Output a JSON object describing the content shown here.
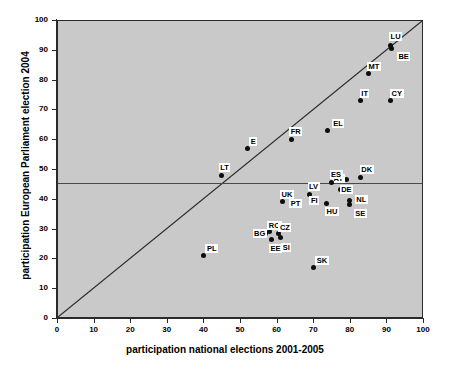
{
  "chart_data": {
    "type": "scatter",
    "title": "",
    "xlabel": "participation national elections 2001-2005",
    "ylabel": "participation European Parliament election 2004",
    "xlim": [
      0,
      100
    ],
    "ylim": [
      0,
      100
    ],
    "xticks": [
      0,
      10,
      20,
      30,
      40,
      50,
      60,
      70,
      80,
      90,
      100
    ],
    "yticks": [
      0,
      10,
      20,
      30,
      40,
      50,
      60,
      70,
      80,
      90,
      100
    ],
    "grid": false,
    "legend": null,
    "point_color": "#0d0d0d",
    "plot_background": "#c9c9c9",
    "reference_lines": [
      {
        "name": "equality-line",
        "type": "diagonal",
        "from": [
          0,
          0
        ],
        "to": [
          100,
          100
        ]
      },
      {
        "name": "eu-average-line",
        "type": "horizontal",
        "y": 45.5
      }
    ],
    "points": [
      {
        "label": "LU",
        "x": 91.0,
        "y": 91.5,
        "label_dx": -1,
        "label_dy": -13
      },
      {
        "label": "BE",
        "x": 91.5,
        "y": 90.5,
        "label_dx": 5,
        "label_dy": 4
      },
      {
        "label": "MT",
        "x": 85.0,
        "y": 82.0,
        "label_dx": -1,
        "label_dy": -12
      },
      {
        "label": "IT",
        "x": 83.0,
        "y": 73.0,
        "label_dx": -1,
        "label_dy": -12
      },
      {
        "label": "CY",
        "x": 91.0,
        "y": 73.0,
        "label_dx": 0,
        "label_dy": -12
      },
      {
        "label": "EL",
        "x": 74.0,
        "y": 63.0,
        "label_dx": 4,
        "label_dy": -11
      },
      {
        "label": "FR",
        "x": 64.0,
        "y": 60.0,
        "label_dx": -2,
        "label_dy": -12
      },
      {
        "label": "E",
        "x": 52.0,
        "y": 57.0,
        "label_dx": 2,
        "label_dy": -11
      },
      {
        "label": "LT",
        "x": 45.0,
        "y": 48.0,
        "label_dx": -3,
        "label_dy": -12
      },
      {
        "label": "DK",
        "x": 83.0,
        "y": 47.0,
        "label_dx": -1,
        "label_dy": -13
      },
      {
        "label": "AT",
        "x": 79.0,
        "y": 46.5,
        "label_dx": -14,
        "label_dy": -5
      },
      {
        "label": "ES",
        "x": 75.0,
        "y": 45.5,
        "label_dx": -2,
        "label_dy": -12
      },
      {
        "label": "LV",
        "x": 69.0,
        "y": 41.5,
        "label_dx": -2,
        "label_dy": -12
      },
      {
        "label": "UK",
        "x": 61.5,
        "y": 39.0,
        "label_dx": -2,
        "label_dy": -12
      },
      {
        "label": "NL",
        "x": 80.0,
        "y": 39.5,
        "label_dx": 5,
        "label_dy": -5
      },
      {
        "label": "DE",
        "x": 77.5,
        "y": 43.0,
        "label_dx": -1,
        "label_dy": -5
      },
      {
        "label": "SE",
        "x": 80.0,
        "y": 38.0,
        "label_dx": 4,
        "label_dy": 4
      },
      {
        "label": "PT",
        "x": 64.0,
        "y": 38.5,
        "label_dx": -2,
        "label_dy": -4
      },
      {
        "label": "FI",
        "x": 69.5,
        "y": 39.5,
        "label_dx": -2,
        "label_dy": -4
      },
      {
        "label": "HU",
        "x": 73.5,
        "y": 38.5,
        "label_dx": -1,
        "label_dy": 4
      },
      {
        "label": "RO",
        "x": 58.0,
        "y": 29.0,
        "label_dx": -2,
        "label_dy": -11
      },
      {
        "label": "CZ",
        "x": 60.5,
        "y": 28.5,
        "label_dx": 0,
        "label_dy": -10
      },
      {
        "label": "BG",
        "x": 57.0,
        "y": 28.5,
        "label_dx": -13,
        "label_dy": -4
      },
      {
        "label": "EE",
        "x": 58.5,
        "y": 26.5,
        "label_dx": -2,
        "label_dy": 5
      },
      {
        "label": "SI",
        "x": 61.0,
        "y": 27.0,
        "label_dx": 1,
        "label_dy": 5
      },
      {
        "label": "SK",
        "x": 70.0,
        "y": 17.0,
        "label_dx": 2,
        "label_dy": -11
      },
      {
        "label": "PL",
        "x": 40.0,
        "y": 21.0,
        "label_dx": 2,
        "label_dy": -11
      }
    ]
  }
}
